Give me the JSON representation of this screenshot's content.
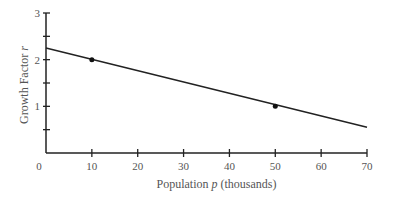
{
  "chart_data": {
    "type": "line",
    "title": "",
    "xlabel": "Population p (thousands)",
    "ylabel": "Growth Factor r",
    "xlim": [
      0,
      70
    ],
    "ylim": [
      0,
      3
    ],
    "x_ticks": [
      0,
      10,
      20,
      30,
      40,
      50,
      60,
      70
    ],
    "y_ticks": [
      1,
      2,
      3
    ],
    "y_minor_ticks": [
      0.5,
      1.5,
      2.5
    ],
    "grid": false,
    "series": [
      {
        "name": "line",
        "x": [
          0,
          70
        ],
        "y": [
          2.25,
          0.55
        ]
      }
    ],
    "points": [
      {
        "x": 10,
        "y": 2.0
      },
      {
        "x": 50,
        "y": 1.0
      }
    ]
  },
  "labels": {
    "xlabel_pre": "Population ",
    "xlabel_var": "p",
    "xlabel_post": " (thousands)",
    "ylabel_pre": "Growth Factor ",
    "ylabel_var": "r"
  }
}
